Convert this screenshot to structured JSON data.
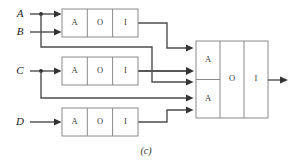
{
  "figure": {
    "caption": "(c)",
    "type": "logic-circuit-schematic"
  },
  "inputs": [
    {
      "id": "A",
      "label": "A",
      "x": 20,
      "y": 14
    },
    {
      "id": "B",
      "label": "B",
      "x": 20,
      "y": 32
    },
    {
      "id": "C",
      "label": "C",
      "x": 20,
      "y": 71
    },
    {
      "id": "D",
      "label": "D",
      "x": 20,
      "y": 122
    }
  ],
  "gates": [
    {
      "id": "aoi-top",
      "name": "aoi-gate-top",
      "cells": [
        "A",
        "O",
        "I"
      ],
      "x": 62,
      "y": 9,
      "width": 76,
      "height": 28
    },
    {
      "id": "aoi-middle",
      "name": "aoi-gate-middle",
      "cells": [
        "A",
        "O",
        "I"
      ],
      "x": 62,
      "y": 57,
      "width": 76,
      "height": 28
    },
    {
      "id": "aoi-bottom",
      "name": "aoi-gate-bottom",
      "cells": [
        "A",
        "O",
        "I"
      ],
      "x": 62,
      "y": 108,
      "width": 76,
      "height": 28
    }
  ],
  "output_gate": {
    "id": "aoi-output",
    "name": "aoi-gate-output",
    "and_cells": [
      "A",
      "A"
    ],
    "or_cell": "O",
    "inv_cell": "I",
    "x": 196,
    "y": 41,
    "width": 72,
    "height": 77
  },
  "output_terminal": {
    "name": "circuit-output",
    "x": 288,
    "y": 80
  },
  "colors": {
    "wire": "#4d4d4d",
    "wire_thick": "#595959",
    "box_stroke": "#8a8a8a",
    "label_text": "#1a1a1a",
    "cell_text": "#3a3a3a",
    "background": "#ffffff"
  },
  "connections": [
    {
      "from": "A",
      "to": "aoi-top.in1"
    },
    {
      "from": "B",
      "to": "aoi-top.in2"
    },
    {
      "from": "A-branch",
      "to": "aoi-output.and1.in2"
    },
    {
      "from": "C",
      "to": "aoi-middle.in1"
    },
    {
      "from": "C-branch",
      "to": "aoi-output.and2.in2"
    },
    {
      "from": "D",
      "to": "aoi-bottom.in1"
    },
    {
      "from": "aoi-top.out",
      "to": "aoi-output.and1.in1"
    },
    {
      "from": "aoi-middle.out",
      "to": "aoi-output.and1.in3"
    },
    {
      "from": "aoi-bottom.out",
      "to": "aoi-output.and2.in3"
    }
  ]
}
